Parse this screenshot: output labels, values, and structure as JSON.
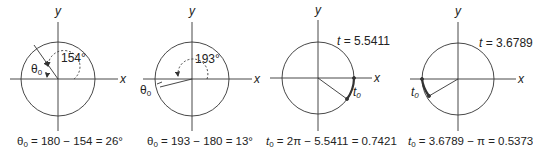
{
  "panels": [
    {
      "axis_x": "x",
      "axis_y": "y",
      "angle_label": "154°",
      "ref_symbol": "θ",
      "ref_sub": "0",
      "caption_sym": "θ",
      "caption_sub": "0",
      "caption_expr": " = 180 − 154 = 26°"
    },
    {
      "axis_x": "x",
      "axis_y": "y",
      "angle_label": "193°",
      "ref_symbol": "θ",
      "ref_sub": "0",
      "caption_sym": "θ",
      "caption_sub": "0",
      "caption_expr": " = 193 − 180 = 13°"
    },
    {
      "axis_x": "x",
      "axis_y": "y",
      "t_label_var": "t",
      "t_label_value": " = 5.5411",
      "ref_symbol": "t",
      "ref_sub": "0",
      "caption_sym": "t",
      "caption_sub": "0",
      "caption_expr": " = 2π − 5.5411 = 0.7421"
    },
    {
      "axis_x": "x",
      "axis_y": "y",
      "t_label_var": "t",
      "t_label_value": " = 3.6789",
      "ref_symbol": "t",
      "ref_sub": "0",
      "caption_sym": "t",
      "caption_sub": "0",
      "caption_expr": " = 3.6789 − π = 0.5373"
    }
  ],
  "colors": {
    "line": "#333333",
    "text": "#222222"
  }
}
